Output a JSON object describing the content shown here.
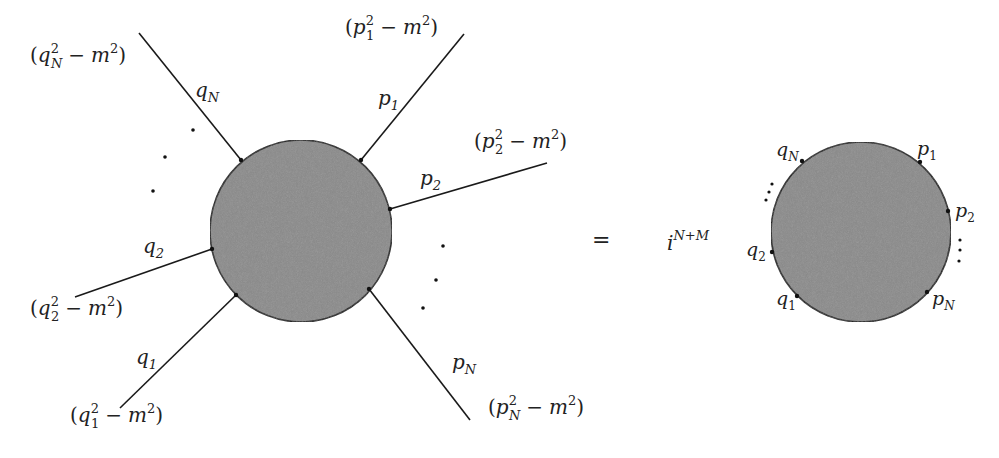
{
  "diagram": {
    "colors": {
      "blob_fill": "#8a8a8a",
      "line": "#1a1a1a",
      "text": "#222222",
      "background": "#ffffff"
    },
    "left_blob": {
      "center": [
        301,
        231
      ],
      "radius": 91,
      "legs": [
        {
          "id": "qN",
          "momentum": "q",
          "sub": "N",
          "propagator": {
            "var": "q",
            "sub": "N"
          },
          "start": [
            139,
            33
          ],
          "vertex": [
            241,
            160
          ]
        },
        {
          "id": "p1",
          "momentum": "p",
          "sub": "1",
          "propagator": {
            "var": "p",
            "sub": "1"
          },
          "start": [
            464,
            34
          ],
          "vertex": [
            361,
            160
          ]
        },
        {
          "id": "p2",
          "momentum": "p",
          "sub": "2",
          "propagator": {
            "var": "p",
            "sub": "2"
          },
          "start": [
            547,
            163
          ],
          "vertex": [
            390,
            209
          ]
        },
        {
          "id": "q2",
          "momentum": "q",
          "sub": "2",
          "propagator": {
            "var": "q",
            "sub": "2"
          },
          "start": [
            75,
            297
          ],
          "vertex": [
            212,
            249
          ]
        },
        {
          "id": "q1",
          "momentum": "q",
          "sub": "1",
          "propagator": {
            "var": "q",
            "sub": "1"
          },
          "start": [
            120,
            408
          ],
          "vertex": [
            236,
            295
          ]
        },
        {
          "id": "pN",
          "momentum": "p",
          "sub": "N",
          "propagator": {
            "var": "p",
            "sub": "N"
          },
          "start": [
            470,
            420
          ],
          "vertex": [
            369,
            289
          ]
        }
      ],
      "labels": {
        "qN": "q",
        "qN_sub": "N",
        "p1": "p",
        "p1_sub": "1",
        "p2": "p",
        "p2_sub": "2",
        "q2": "q",
        "q2_sub": "2",
        "q1": "q",
        "q1_sub": "1",
        "pN": "p",
        "pN_sub": "N"
      },
      "propagators": {
        "qN": {
          "open": "(",
          "var": "q",
          "sup": "2",
          "sub": "N",
          "minus": "−",
          "mass": "m",
          "mass_sup": "2",
          "close": ")"
        },
        "p1": {
          "open": "(",
          "var": "p",
          "sup": "2",
          "sub": "1",
          "minus": "−",
          "mass": "m",
          "mass_sup": "2",
          "close": ")"
        },
        "p2": {
          "open": "(",
          "var": "p",
          "sup": "2",
          "sub": "2",
          "minus": "−",
          "mass": "m",
          "mass_sup": "2",
          "close": ")"
        },
        "q2": {
          "open": "(",
          "var": "q",
          "sup": "2",
          "sub": "2",
          "minus": "−",
          "mass": "m",
          "mass_sup": "2",
          "close": ")"
        },
        "q1": {
          "open": "(",
          "var": "q",
          "sup": "2",
          "sub": "1",
          "minus": "−",
          "mass": "m",
          "mass_sup": "2",
          "close": ")"
        },
        "pN": {
          "open": "(",
          "var": "p",
          "sup": "2",
          "sub": "N",
          "minus": "−",
          "mass": "m",
          "mass_sup": "2",
          "close": ")"
        }
      },
      "ellipsis_left_dots": [
        [
          193,
          130
        ],
        [
          165,
          157
        ],
        [
          153,
          191
        ]
      ],
      "ellipsis_right_dots": [
        [
          443,
          246
        ],
        [
          436,
          280
        ],
        [
          423,
          308
        ]
      ]
    },
    "equals": "=",
    "prefactor": {
      "base": "i",
      "exponent": "N+M"
    },
    "right_blob": {
      "center": [
        861,
        232
      ],
      "radius": 90,
      "vertices": {
        "qN": [
          802,
          161
        ],
        "p1": [
          920,
          162
        ],
        "p2": [
          948,
          211
        ],
        "q2": [
          772,
          252
        ],
        "q1": [
          797,
          296
        ],
        "pN": [
          927,
          292
        ]
      },
      "labels": {
        "qN": "q",
        "qN_sub": "N",
        "p1": "p",
        "p1_sub": "1",
        "p2": "p",
        "p2_sub": "2",
        "q2": "q",
        "q2_sub": "2",
        "q1": "q",
        "q1_sub": "1",
        "pN": "p",
        "pN_sub": "N"
      },
      "vdots_left": [
        [
          772,
          184
        ],
        [
          769,
          192
        ],
        [
          766,
          200
        ]
      ],
      "vdots_right": [
        [
          960,
          240
        ],
        [
          960,
          250
        ],
        [
          959,
          261
        ]
      ]
    }
  }
}
